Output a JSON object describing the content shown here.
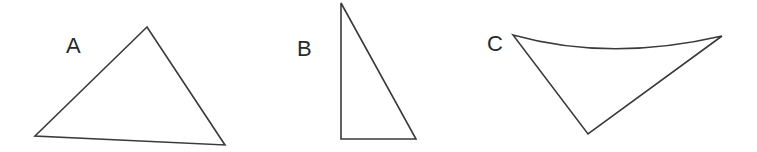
{
  "figure": {
    "shapes": [
      {
        "label": "A",
        "type": "triangle",
        "kind": "scalene",
        "label_pos": [
          66,
          35
        ],
        "vertices": [
          [
            147,
            27
          ],
          [
            35,
            136
          ],
          [
            225,
            145
          ]
        ]
      },
      {
        "label": "B",
        "type": "triangle",
        "kind": "right",
        "label_pos": [
          297,
          38
        ],
        "vertices": [
          [
            341,
            3
          ],
          [
            341,
            139
          ],
          [
            416,
            139
          ]
        ]
      },
      {
        "label": "C",
        "type": "curved-triangle",
        "kind": "one curved side (top edge sags downward)",
        "label_pos": [
          487,
          33
        ],
        "vertices": [
          [
            513,
            35
          ],
          [
            722,
            36
          ],
          [
            588,
            134
          ]
        ],
        "curve_control": [
          610,
          62
        ]
      }
    ],
    "colors": {
      "stroke": "#3a3a3a",
      "text": "#2a2a2a",
      "background": "#ffffff"
    }
  }
}
